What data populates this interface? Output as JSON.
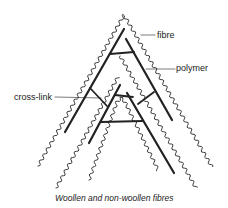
{
  "diagram": {
    "labels": {
      "fibre": "fibre",
      "polymer": "polymer",
      "cross_link": "cross-link"
    },
    "caption": "Woollen and non-woollen fibres",
    "colors": {
      "ink": "#222222",
      "background": "#ffffff"
    }
  }
}
